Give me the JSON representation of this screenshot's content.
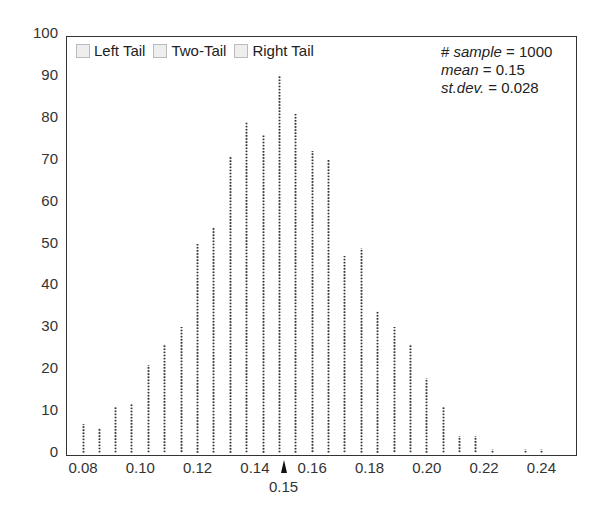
{
  "chart_data": {
    "type": "bar",
    "title": "",
    "xlabel": "",
    "ylabel": "",
    "ylim": [
      0,
      100
    ],
    "xlim": [
      0.072,
      0.259
    ],
    "yticks": [
      "0",
      "10",
      "20",
      "30",
      "40",
      "50",
      "60",
      "70",
      "80",
      "90",
      "100"
    ],
    "xticks": [
      "0.08",
      "0.10",
      "0.12",
      "0.14",
      "0.16",
      "0.18",
      "0.20",
      "0.22",
      "0.24"
    ],
    "grid": false,
    "style": "dotted vertical lines (dot plot histogram)",
    "legend": {
      "position": "top-left inside",
      "entries": [
        "Left Tail",
        "Two-Tail",
        "Right Tail"
      ]
    },
    "annotations": {
      "sample_label": "# sample",
      "sample_value": "1000",
      "mean_label": "mean",
      "mean_value": "0.15",
      "sd_label": "st.dev.",
      "sd_value": "0.028",
      "mean_marker_label": "0.15"
    },
    "x": [
      0.08,
      0.0857,
      0.0914,
      0.0971,
      0.1029,
      0.1086,
      0.1143,
      0.12,
      0.1257,
      0.1314,
      0.1371,
      0.1429,
      0.1486,
      0.1543,
      0.16,
      0.1657,
      0.1714,
      0.1771,
      0.1829,
      0.1886,
      0.1943,
      0.2,
      0.2057,
      0.2114,
      0.2171,
      0.2229,
      0.2343,
      0.24
    ],
    "values": [
      7,
      6,
      11,
      12,
      21,
      26,
      30,
      50,
      54,
      71,
      79,
      76,
      90,
      81,
      72,
      70,
      47,
      49,
      34,
      30,
      26,
      18,
      11,
      4,
      4,
      1,
      1,
      1
    ]
  },
  "legend_labels": {
    "left": "Left Tail",
    "two": "Two-Tail",
    "right": "Right Tail"
  },
  "stats": {
    "sample_label": "# sample",
    "sample_value": " = 1000",
    "mean_label": "mean",
    "mean_value": " = 0.15",
    "sd_label": "st.dev.",
    "sd_value": " = 0.028"
  },
  "mean_marker_label": "0.15"
}
